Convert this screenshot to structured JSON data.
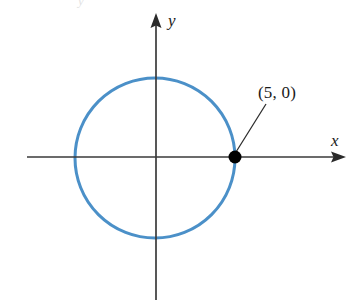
{
  "figure": {
    "caption_visible": false,
    "background_color": "#ffffff",
    "artifact_glyph": "y"
  },
  "axes": {
    "x": {
      "label": "x",
      "color": "#3a3a3a",
      "y_position": 157,
      "x_start": 27,
      "x_end": 345,
      "arrow": "right",
      "label_x": 331,
      "label_y": 132
    },
    "y": {
      "label": "y",
      "color": "#3a3a3a",
      "x_position": 156,
      "y_start": 14,
      "y_end": 300,
      "arrow": "up",
      "label_x": 168,
      "label_y": 12
    }
  },
  "annotation": {
    "point_label": "(5, 0)",
    "label_x": 258,
    "label_y": 84,
    "leader_from": [
      236,
      152
    ],
    "leader_to": [
      266,
      104
    ]
  },
  "chart_data": {
    "type": "scatter",
    "title": "",
    "xlabel": "x",
    "ylabel": "y",
    "grid": false,
    "legend": null,
    "xlim": [
      -10,
      12
    ],
    "ylim": [
      -9,
      9
    ],
    "shapes": [
      {
        "kind": "circle",
        "name": "circle-curve",
        "center": [
          0,
          0
        ],
        "radius": 5,
        "stroke_color": "#4b90c8",
        "stroke_width": 3,
        "fill": "none",
        "pixel_center": [
          155,
          158
        ],
        "pixel_radius": 80
      }
    ],
    "points": [
      {
        "name": "point-5-0",
        "label": "(5, 0)",
        "x": 5,
        "y": 0,
        "color": "#000000",
        "marker": "filled-circle",
        "pixel_x": 235,
        "pixel_y": 157,
        "pixel_radius": 6.5
      }
    ]
  }
}
